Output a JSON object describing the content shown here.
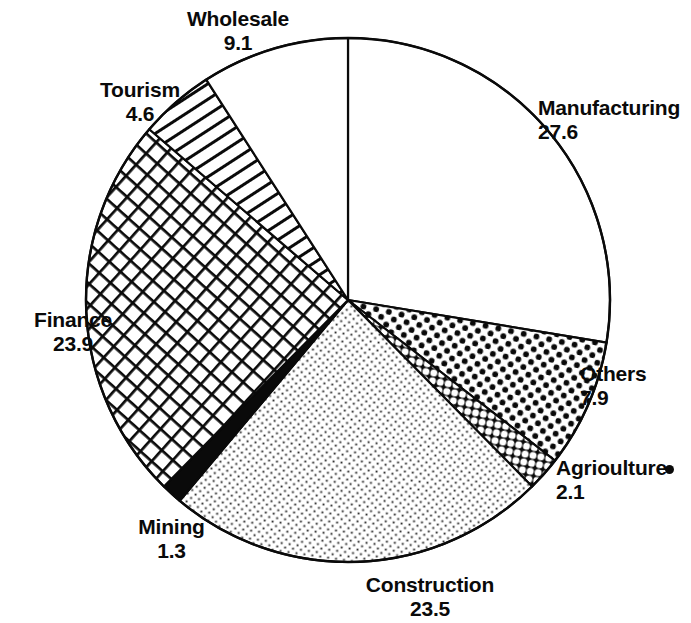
{
  "chart_data": {
    "type": "pie",
    "title": "",
    "subtitle": "",
    "units": "percent",
    "total": 100.0,
    "start_angle_deg": 0,
    "direction": "clockwise",
    "legend_position": "none",
    "labels_outside": true,
    "categories": [
      "Manufacturing",
      "Others",
      "Agriculture",
      "Construction",
      "Mining",
      "Finance",
      "Tourism",
      "Wholesale"
    ],
    "values": [
      27.6,
      7.9,
      2.1,
      23.5,
      1.3,
      23.9,
      4.6,
      9.1
    ],
    "slices": [
      {
        "label": "Manufacturing",
        "value": 27.6,
        "value_text": "27.6",
        "fill": "white",
        "start_deg": 0.0,
        "end_deg": 99.36
      },
      {
        "label": "Others",
        "value": 7.9,
        "value_text": "7.9",
        "fill": "bold-dots",
        "start_deg": 99.36,
        "end_deg": 127.8
      },
      {
        "label": "Agriculture",
        "value": 2.1,
        "value_text": "2.1",
        "fill": "honeycomb",
        "start_deg": 127.8,
        "end_deg": 135.36
      },
      {
        "label": "Construction",
        "value": 23.5,
        "value_text": "23.5",
        "fill": "fine-stipple",
        "start_deg": 135.36,
        "end_deg": 219.96
      },
      {
        "label": "Mining",
        "value": 1.3,
        "value_text": "1.3",
        "fill": "solid-black",
        "start_deg": 219.96,
        "end_deg": 224.64
      },
      {
        "label": "Finance",
        "value": 23.9,
        "value_text": "23.9",
        "fill": "cross-hatch",
        "start_deg": 224.64,
        "end_deg": 310.68
      },
      {
        "label": "Tourism",
        "value": 4.6,
        "value_text": "4.6",
        "fill": "diagonal-lines",
        "start_deg": 310.68,
        "end_deg": 327.24
      },
      {
        "label": "Wholesale",
        "value": 9.1,
        "value_text": "9.1",
        "fill": "white",
        "start_deg": 327.24,
        "end_deg": 360.0
      }
    ],
    "colors": {
      "ink": "#0a0a0a",
      "background": "#ffffff"
    }
  },
  "labels": {
    "manufacturing": {
      "name": "Manufacturing",
      "value": "27.6"
    },
    "others": {
      "name": "Others",
      "value": "7.9"
    },
    "agriculture": {
      "name": "Agrioulture",
      "value": "2.1"
    },
    "construction": {
      "name": "Construction",
      "value": "23.5"
    },
    "mining": {
      "name": "Mining",
      "value": "1.3"
    },
    "finance": {
      "name": "Finance",
      "value": "23.9"
    },
    "tourism": {
      "name": "Tourism",
      "value": "4.6"
    },
    "wholesale": {
      "name": "Wholesale",
      "value": "9.1"
    }
  }
}
